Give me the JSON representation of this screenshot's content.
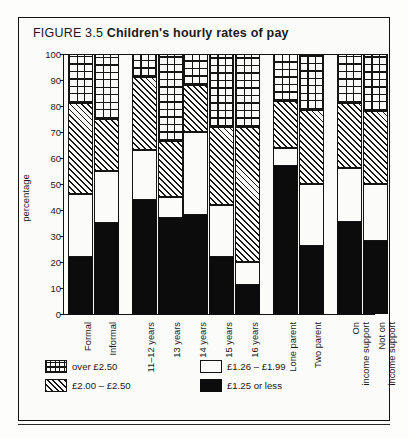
{
  "figure": {
    "number_label": "FIGURE 3.5",
    "title": "Children's hourly rates of pay"
  },
  "chart_data": {
    "type": "bar",
    "subtype": "stacked-bar-100",
    "title": "Children's hourly rates of pay",
    "xlabel": "",
    "ylabel": "percentage",
    "ylim": [
      0,
      100
    ],
    "yticks": [
      0,
      10,
      20,
      30,
      40,
      50,
      60,
      70,
      80,
      90,
      100
    ],
    "ytick_labels": [
      "0",
      "10",
      "20",
      "30",
      "40",
      "50",
      "60",
      "70",
      "80",
      "90",
      "100"
    ],
    "grid": false,
    "legend_position": "below-plot",
    "categories": [
      "Formal",
      "Informal",
      "11–12 years",
      "13 years",
      "14 years",
      "15 years",
      "16 years",
      "Lone parent",
      "Two parent",
      "On\nincome support",
      "Not on\nincome support"
    ],
    "group_gaps_after": [
      "Informal",
      "16 years",
      "Two parent"
    ],
    "series": [
      {
        "name": "£1.25 or less",
        "fill": "black",
        "values": [
          22,
          35,
          44,
          37,
          38,
          22,
          11,
          57,
          26,
          35.5,
          28
        ]
      },
      {
        "name": "£1.26 – £1.99",
        "fill": "white",
        "values": [
          24,
          20,
          19,
          8,
          32,
          20,
          9,
          7,
          24,
          20.5,
          22
        ]
      },
      {
        "name": "£2.00 – £2.50",
        "fill": "diagonal-hatch",
        "values": [
          35,
          20,
          28,
          21.5,
          18,
          30,
          52,
          18,
          28.5,
          25,
          28
        ]
      },
      {
        "name": "over £2.50",
        "fill": "cross-grid",
        "values": [
          19,
          25,
          9,
          33.5,
          12,
          28,
          28,
          18,
          21.5,
          19,
          22
        ]
      }
    ],
    "cumulative_tops": {
      "Formal": [
        22,
        46,
        81,
        100
      ],
      "Informal": [
        35,
        55,
        75,
        100
      ],
      "11–12 years": [
        44,
        63,
        91,
        100
      ],
      "13 years": [
        37,
        45,
        66.5,
        100
      ],
      "14 years": [
        38,
        70,
        88,
        100
      ],
      "15 years": [
        22,
        42,
        72,
        100
      ],
      "16 years": [
        11,
        20,
        72,
        100
      ],
      "Lone parent": [
        57,
        64,
        82,
        100
      ],
      "Two parent": [
        26,
        50,
        78.5,
        100
      ],
      "On\nincome support": [
        35.5,
        56,
        81,
        100
      ],
      "Not on\nincome support": [
        28,
        50,
        78,
        100
      ]
    }
  },
  "legend": {
    "items": [
      {
        "label": "over £2.50",
        "swatch": "cross-grid"
      },
      {
        "label": "£1.26 – £1.99",
        "swatch": "white"
      },
      {
        "label": "£2.00 – £2.50",
        "swatch": "diagonal-hatch"
      },
      {
        "label": "£1.25 or less",
        "swatch": "black"
      }
    ]
  },
  "colors": {
    "ink": "#111111",
    "paper": "#fbfbf9",
    "black_fill": "#0c0c0c"
  }
}
